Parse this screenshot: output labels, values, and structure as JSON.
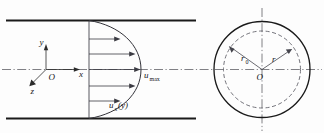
{
  "figure": {
    "colors": {
      "wall": "#1a1a1a",
      "line": "#33333a",
      "centerline": "#55555c",
      "dashed_circle": "#5a5a62",
      "background": "#fdfdfd"
    }
  },
  "left_panel": {
    "name": "longitudinal-section",
    "axes": {
      "origin_label": "O",
      "y_label": "y",
      "x_label": "x",
      "z_label": "z"
    },
    "labels": {
      "u_max_base": "u",
      "u_max_sub": "max",
      "u_x_base": "u",
      "u_x_sub": "x",
      "u_x_arg": "(y)"
    },
    "velocity_arrows": 5,
    "profile_shape": "parabolic"
  },
  "right_panel": {
    "name": "cross-section",
    "labels": {
      "r0_base": "r",
      "r0_sub": "0",
      "r_label": "r",
      "center_label": "O"
    },
    "outer_circle_style": "solid",
    "inner_circle_style": "dashed"
  }
}
